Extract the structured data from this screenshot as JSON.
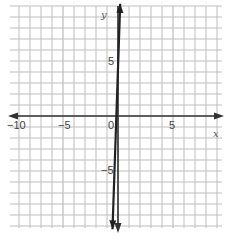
{
  "chart_data": {
    "type": "line",
    "title": "",
    "xlabel": "x",
    "ylabel": "y",
    "xlim": [
      -10,
      9
    ],
    "ylim": [
      -10,
      10
    ],
    "grid": true,
    "grid_step": 1,
    "x_ticks": [
      {
        "value": -10,
        "label": "−10"
      },
      {
        "value": -5,
        "label": "−5"
      },
      {
        "value": 0,
        "label": "0"
      },
      {
        "value": 5,
        "label": "5"
      }
    ],
    "y_ticks": [
      {
        "value": 5,
        "label": "5"
      },
      {
        "value": -5,
        "label": "−5"
      }
    ],
    "series": [
      {
        "name": "line",
        "description": "very steep line through near the origin, arrows both ends",
        "points": [
          [
            0.2,
            10.2
          ],
          [
            -0.5,
            -10.3
          ]
        ],
        "approx_slope": 29,
        "color": "#222222"
      }
    ]
  },
  "colors": {
    "grid": "#bdbdbd",
    "axis": "#333333",
    "line": "#1f1f1f",
    "background": "#ffffff"
  }
}
